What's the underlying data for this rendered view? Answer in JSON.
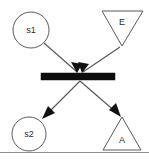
{
  "diagram": {
    "type": "petri-net-transition",
    "canvas": {
      "width": 149,
      "height": 160,
      "background": "#ffffff"
    },
    "colors": {
      "shape_stroke": "#5a5a5a",
      "shape_fill": "#ffffff",
      "arc_stroke": "#555555",
      "arrow_fill": "#111111",
      "transition_fill": "#0d0d0d",
      "label_color": "#2b2b2b",
      "frame_rule": "#8d8d8d"
    },
    "nodes": [
      {
        "id": "s1",
        "label": "s1",
        "shape": "circle",
        "role": "source-place",
        "cx": 31,
        "cy": 30,
        "r": 18,
        "label_x": 31,
        "label_y": 31
      },
      {
        "id": "E",
        "label": "E",
        "shape": "triangle-down",
        "role": "event-input",
        "points": "102,11 143,11 122,46",
        "label_x": 122,
        "label_y": 23
      },
      {
        "id": "s2",
        "label": "s2",
        "shape": "circle",
        "role": "target-place",
        "cx": 29,
        "cy": 134,
        "r": 17,
        "label_x": 29,
        "label_y": 135
      },
      {
        "id": "A",
        "label": "A",
        "shape": "triangle-up",
        "role": "action-output",
        "points": "122,117 141,150 103,150",
        "label_x": 122,
        "label_y": 141
      }
    ],
    "transition": {
      "id": "t1",
      "shape": "bar",
      "x": 41,
      "y": 73,
      "width": 74,
      "height": 7
    },
    "arcs": [
      {
        "id": "arc-s1-to-transition",
        "from": "s1",
        "to": "t1",
        "direction": "in",
        "x1": 44,
        "y1": 43,
        "x2": 77,
        "y2": 72,
        "head_angle_deg": 41
      },
      {
        "id": "arc-E-to-transition",
        "from": "E",
        "to": "t1",
        "direction": "in",
        "x1": 120,
        "y1": 47,
        "x2": 83,
        "y2": 72,
        "head_angle_deg": 146
      },
      {
        "id": "arc-transition-to-s2",
        "from": "t1",
        "to": "s2",
        "direction": "out",
        "x1": 80,
        "y1": 81,
        "x2": 44,
        "y2": 117,
        "head_angle_deg": 135
      },
      {
        "id": "arc-transition-to-A",
        "from": "t1",
        "to": "A",
        "direction": "out",
        "x1": 80,
        "y1": 81,
        "x2": 119,
        "y2": 115,
        "head_angle_deg": 41
      }
    ],
    "frame": {
      "bottom_rule": {
        "x1": 0,
        "y1": 152.5,
        "x2": 149,
        "y2": 152.5
      }
    }
  }
}
